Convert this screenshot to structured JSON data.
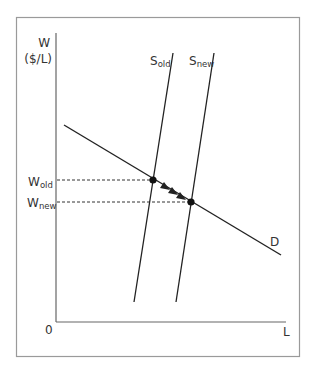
{
  "diagram": {
    "type": "supply-demand",
    "y_axis": {
      "label": "W",
      "unit": "($/L)"
    },
    "x_axis": {
      "label": "L",
      "origin": "0"
    },
    "curves": {
      "supply_old": {
        "base": "S",
        "sub": "old"
      },
      "supply_new": {
        "base": "S",
        "sub": "new"
      },
      "demand": {
        "label": "D"
      }
    },
    "wage_levels": {
      "old": {
        "base": "W",
        "sub": "old"
      },
      "new": {
        "base": "W",
        "sub": "new"
      }
    },
    "colors": {
      "line": "#222222",
      "frame": "#9a9a9a",
      "axis": "#666666"
    }
  }
}
